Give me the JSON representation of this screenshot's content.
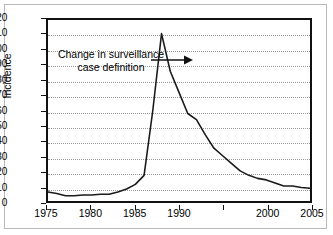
{
  "figure": {
    "annotation": {
      "line1": "Change in surveillance",
      "line2": "case definition",
      "arrow_icon": "arrow-right-icon"
    }
  },
  "chart_data": {
    "type": "line",
    "title": "",
    "xlabel": "",
    "ylabel": "Incidence",
    "xlim": [
      1975,
      2005
    ],
    "ylim": [
      0,
      120
    ],
    "ytick_values": [
      0,
      10,
      20,
      30,
      40,
      50,
      60,
      70,
      80,
      90,
      100,
      110,
      120
    ],
    "ytick_labels": [
      "0",
      "10",
      "20",
      "30",
      "40",
      "50",
      "60",
      "70",
      "80",
      "90",
      "100",
      "110",
      "120"
    ],
    "xtick_values": [
      1975,
      1980,
      1985,
      1990,
      1995,
      2000,
      2005
    ],
    "xtick_labels": [
      "1975",
      "1980",
      "1985",
      "1990",
      "",
      "2000",
      "2005"
    ],
    "grid": "horizontal-dotted",
    "legend": "none",
    "line_color": "#1a1a1a",
    "x": [
      1975,
      1976,
      1977,
      1978,
      1979,
      1980,
      1981,
      1982,
      1983,
      1984,
      1985,
      1986,
      1987,
      1988,
      1989,
      1990,
      1991,
      1992,
      1993,
      1994,
      1995,
      1996,
      1997,
      1998,
      1999,
      2000,
      2001,
      2002,
      2003,
      2004,
      2005
    ],
    "values": [
      6,
      5,
      3.5,
      3.5,
      4,
      4,
      4.5,
      4.5,
      6,
      8,
      11,
      17,
      60,
      111,
      86,
      72,
      58,
      54,
      44,
      35,
      30,
      25,
      20,
      17,
      15,
      14,
      12,
      10,
      10,
      9,
      8.5
    ],
    "annotations": [
      {
        "text": "Change in surveillance case definition",
        "points_to_x": 1987,
        "points_to_y": 92,
        "arrow": "right"
      }
    ]
  }
}
